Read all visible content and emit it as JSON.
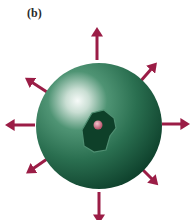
{
  "figure": {
    "panel_label": "(b)",
    "colors": {
      "sphere_dark": "#0f4a33",
      "sphere_mid": "#2e7a58",
      "sphere_highlight": "#f4f8f6",
      "inner_region": "#0e4029",
      "inner_outline": "#4f8f72",
      "dot": "#d07a8c",
      "arrow": "#9b1d46"
    },
    "arrows": [
      {
        "direction": "up"
      },
      {
        "direction": "up-right"
      },
      {
        "direction": "right"
      },
      {
        "direction": "down-right"
      },
      {
        "direction": "down"
      },
      {
        "direction": "down-left"
      },
      {
        "direction": "left"
      },
      {
        "direction": "up-left"
      }
    ]
  }
}
